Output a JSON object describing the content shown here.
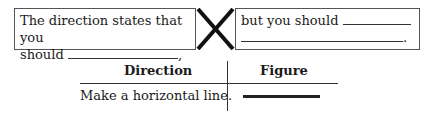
{
  "left_box": {
    "line1": "The direction states that you",
    "line2_prefix": "should",
    "line2_suffix": ","
  },
  "connector": {
    "icon": "x-mark-icon"
  },
  "right_box": {
    "line1_prefix": "but you  should",
    "line2_suffix": "."
  },
  "table": {
    "headers": [
      "Direction",
      "Figure"
    ],
    "rows": [
      {
        "direction": "Make a horizontal line.",
        "figure": "horizontal-line-figure"
      }
    ]
  }
}
